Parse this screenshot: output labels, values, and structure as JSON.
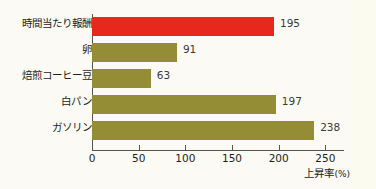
{
  "chart_data": {
    "type": "bar",
    "orientation": "horizontal",
    "title": "",
    "xlabel": "上昇率",
    "xunit": "(%)",
    "ylabel": "",
    "xlim": [
      0,
      270
    ],
    "grid": false,
    "legend": null,
    "xticks": [
      0,
      50,
      100,
      150,
      200,
      250
    ],
    "xticklabels": [
      "0",
      "50",
      "100",
      "150",
      "200",
      "250"
    ],
    "categories": [
      "時間当たり報酬",
      "卵",
      "焙煎コーヒー豆",
      "白パン",
      "ガソリン"
    ],
    "values": [
      195,
      91,
      63,
      197,
      238
    ],
    "value_labels": [
      "195",
      "91",
      "63",
      "197",
      "238"
    ],
    "bars": [
      {
        "category": "時間当たり報酬",
        "value": 195,
        "label": "195",
        "color": "#e8281c",
        "highlight": true
      },
      {
        "category": "卵",
        "value": 91,
        "label": "91",
        "color": "#948d35",
        "highlight": false
      },
      {
        "category": "焙煎コーヒー豆",
        "value": 63,
        "label": "63",
        "color": "#948d35",
        "highlight": false
      },
      {
        "category": "白パン",
        "value": 197,
        "label": "197",
        "color": "#948d35",
        "highlight": false
      },
      {
        "category": "ガソリン",
        "value": 238,
        "label": "238",
        "color": "#948d35",
        "highlight": false
      }
    ],
    "colors": {
      "highlight_bar": "#e8281c",
      "default_bar": "#948d35",
      "axis": "#55544f",
      "text": "#1d1d1b",
      "background": "#fbfaf4"
    }
  }
}
